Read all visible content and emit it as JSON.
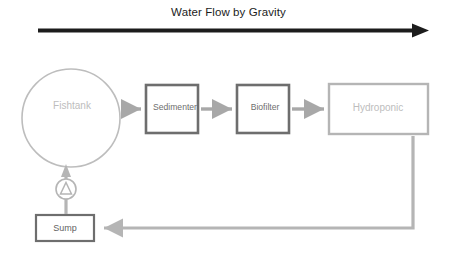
{
  "diagram": {
    "title": "Water Flow by Gravity",
    "colors": {
      "title_arrow": "#1c1c1c",
      "light_gray": "#bdbdbd",
      "mid_gray": "#a8a8a8",
      "dark_gray": "#6e6e6e",
      "background": "#ffffff"
    },
    "nodes": [
      {
        "id": "fishtank",
        "label": "Fishtank",
        "shape": "circle"
      },
      {
        "id": "sedimenter",
        "label": "Sedimenter",
        "shape": "rect"
      },
      {
        "id": "biofilter",
        "label": "Biofilter",
        "shape": "rect"
      },
      {
        "id": "hydroponic",
        "label": "Hydroponic",
        "shape": "rect"
      },
      {
        "id": "sump",
        "label": "Sump",
        "shape": "rect"
      },
      {
        "id": "pump",
        "label": "",
        "shape": "pump-symbol"
      }
    ],
    "connections": [
      {
        "from": "fishtank",
        "to": "sedimenter",
        "direction": "right"
      },
      {
        "from": "sedimenter",
        "to": "biofilter",
        "direction": "right"
      },
      {
        "from": "biofilter",
        "to": "hydroponic",
        "direction": "right"
      },
      {
        "from": "hydroponic",
        "to": "sump",
        "direction": "left"
      },
      {
        "from": "sump",
        "to": "fishtank",
        "direction": "up"
      }
    ]
  }
}
